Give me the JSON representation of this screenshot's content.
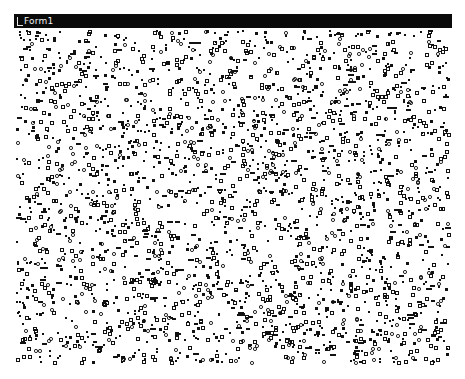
{
  "window": {
    "title": "Form1",
    "icon": "window-system-menu-icon"
  },
  "colors": {
    "titlebar_bg": "#0a0a0a",
    "titlebar_text": "#f2f2f2",
    "client_bg": "#ffffff",
    "dot": "#111111"
  },
  "canvas": {
    "width": 438,
    "height": 338,
    "description": "Random scatter of small black filled squares and hollow squares/circles",
    "dot_count": 2600,
    "seed": 1337,
    "shapes": [
      "filled-square",
      "hollow-square",
      "hollow-circle",
      "dash"
    ]
  }
}
